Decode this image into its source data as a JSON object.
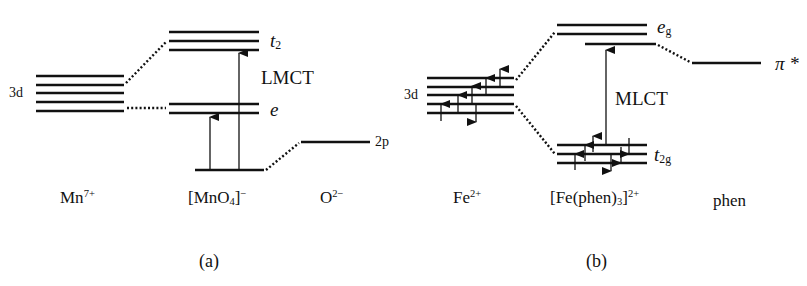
{
  "panel_a": {
    "caption": "(a)",
    "orbital_3d": "3d",
    "t2_label": "t",
    "t2_sub": "2",
    "e_label": "e",
    "transition": "LMCT",
    "o_2p": "2p",
    "species": {
      "metal": "Mn",
      "metal_charge": "7+",
      "complex_open": "[MnO",
      "complex_sub": "4",
      "complex_close": "]",
      "complex_charge": "−",
      "ligand": "O",
      "ligand_charge": "2−"
    }
  },
  "panel_b": {
    "caption": "(b)",
    "orbital_3d": "3d",
    "eg_label": "e",
    "eg_sub": "g",
    "t2g_label": "t",
    "t2g_sub": "2g",
    "transition": "MLCT",
    "pi_star": "π *",
    "species": {
      "metal": "Fe",
      "metal_charge": "2+",
      "complex_open": "[Fe(phen)",
      "complex_sub": "3",
      "complex_close": "]",
      "complex_charge": "2+",
      "ligand": "phen"
    }
  },
  "colors": {
    "ink": "#111111",
    "background": "#ffffff"
  }
}
